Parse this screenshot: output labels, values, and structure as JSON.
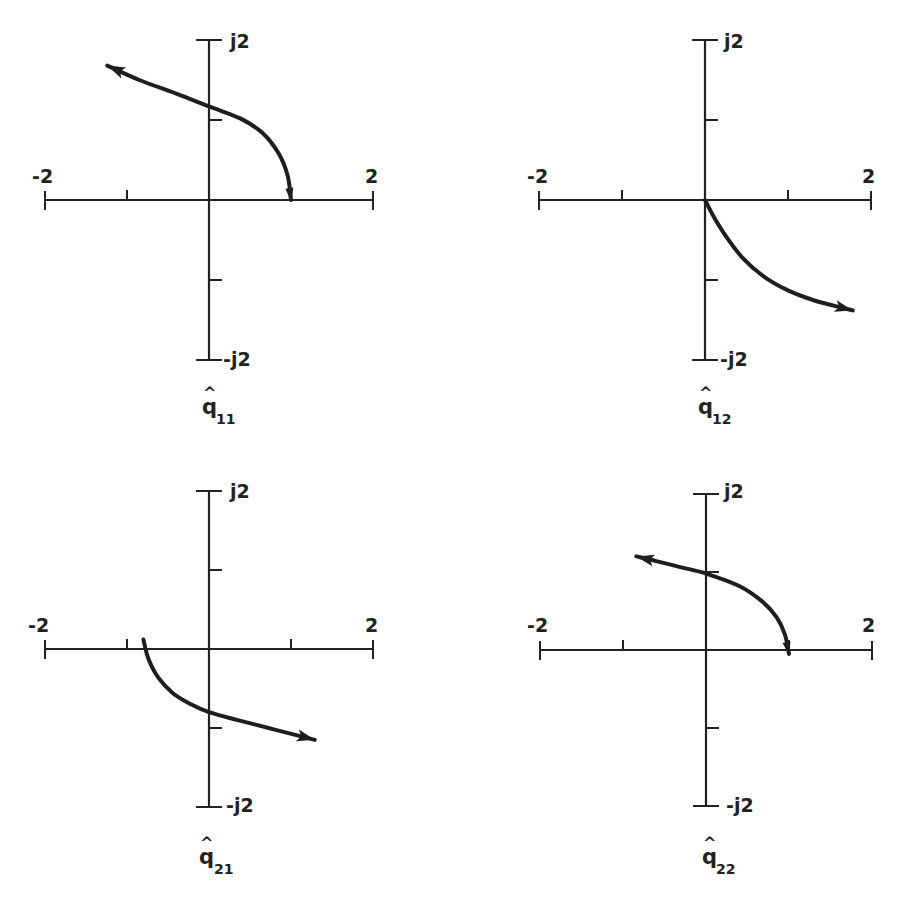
{
  "figure": {
    "layout": "2x2 grid of complex-plane loci"
  },
  "chart_data": [
    {
      "type": "line",
      "panel": "q11",
      "title": "q̂11",
      "title_base": "q",
      "title_hat": "^",
      "title_subscript": "11",
      "xlabel": "",
      "ylabel": "",
      "xlim": [
        -2,
        2
      ],
      "ylim": [
        -2,
        2
      ],
      "x_tick_labels": {
        "left": "-2",
        "right": "2"
      },
      "y_tick_labels": {
        "top": "j2",
        "bottom": "-j2"
      },
      "x_ticks": [
        -2,
        -1,
        0,
        1,
        2
      ],
      "y_ticks": [
        -2,
        -1,
        0,
        1,
        2
      ],
      "grid": false,
      "arrow_at_end": true,
      "arrow_at_start": true,
      "series": [
        {
          "name": "locus",
          "x": [
            1.0,
            0.96,
            0.85,
            0.65,
            0.38,
            0.0,
            -0.4,
            -0.85,
            -1.24
          ],
          "y": [
            0.0,
            0.3,
            0.58,
            0.84,
            1.02,
            1.17,
            1.33,
            1.5,
            1.68
          ]
        }
      ]
    },
    {
      "type": "line",
      "panel": "q12",
      "title": "q̂12",
      "title_base": "q",
      "title_hat": "^",
      "title_subscript": "12",
      "xlabel": "",
      "ylabel": "",
      "xlim": [
        -2,
        2
      ],
      "ylim": [
        -2,
        2
      ],
      "x_tick_labels": {
        "left": "-2",
        "right": "2"
      },
      "y_tick_labels": {
        "top": "j2",
        "bottom": "-j2"
      },
      "x_ticks": [
        -2,
        -1,
        0,
        1,
        2
      ],
      "y_ticks": [
        -2,
        -1,
        0,
        1,
        2
      ],
      "grid": false,
      "arrow_at_end": true,
      "arrow_at_start": false,
      "series": [
        {
          "name": "locus",
          "x": [
            0.0,
            0.1,
            0.25,
            0.45,
            0.7,
            1.0,
            1.3,
            1.55,
            1.78
          ],
          "y": [
            0.0,
            -0.2,
            -0.45,
            -0.72,
            -0.95,
            -1.13,
            -1.25,
            -1.32,
            -1.38
          ]
        }
      ]
    },
    {
      "type": "line",
      "panel": "q21",
      "title": "q̂21",
      "title_base": "q",
      "title_hat": "^",
      "title_subscript": "21",
      "xlabel": "",
      "ylabel": "",
      "xlim": [
        -2,
        2
      ],
      "ylim": [
        -2,
        2
      ],
      "x_tick_labels": {
        "left": "-2",
        "right": "2"
      },
      "y_tick_labels": {
        "top": "j2",
        "bottom": "-j2"
      },
      "x_ticks": [
        -2,
        -1,
        0,
        1,
        2
      ],
      "y_ticks": [
        -2,
        -1,
        0,
        1,
        2
      ],
      "grid": false,
      "arrow_at_end": true,
      "arrow_at_start": false,
      "series": [
        {
          "name": "locus",
          "x": [
            -0.8,
            -0.74,
            -0.62,
            -0.44,
            -0.22,
            0.0,
            0.35,
            0.8,
            1.29
          ],
          "y": [
            0.12,
            -0.12,
            -0.36,
            -0.56,
            -0.7,
            -0.8,
            -0.9,
            -1.02,
            -1.15
          ]
        }
      ]
    },
    {
      "type": "line",
      "panel": "q22",
      "title": "q̂22",
      "title_base": "q",
      "title_hat": "^",
      "title_subscript": "22",
      "xlabel": "",
      "ylabel": "",
      "xlim": [
        -2,
        2
      ],
      "ylim": [
        -2,
        2
      ],
      "x_tick_labels": {
        "left": "-2",
        "right": "2"
      },
      "y_tick_labels": {
        "top": "j2",
        "bottom": "-j2"
      },
      "x_ticks": [
        -2,
        -1,
        0,
        1,
        2
      ],
      "y_ticks": [
        -2,
        -1,
        0,
        1,
        2
      ],
      "grid": false,
      "arrow_at_end": true,
      "arrow_at_start": true,
      "series": [
        {
          "name": "locus",
          "x": [
            1.0,
            0.95,
            0.85,
            0.68,
            0.4,
            0.0,
            -0.3,
            -0.6,
            -0.84
          ],
          "y": [
            -0.05,
            0.2,
            0.42,
            0.62,
            0.82,
            0.98,
            1.06,
            1.14,
            1.2
          ]
        }
      ]
    }
  ]
}
